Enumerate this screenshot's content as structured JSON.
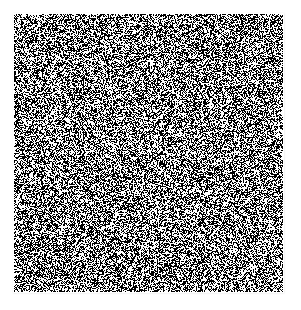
{
  "figure": {
    "kind": "noise-texture",
    "canvas_width": 301,
    "canvas_height": 310,
    "background_color": "#ffffff"
  },
  "chart_data": {
    "type": "heatmap",
    "title": "",
    "subtitle": "",
    "xlabel": "",
    "ylabel": "",
    "legend": [],
    "annotations": [],
    "grid": false,
    "axes_visible": false,
    "tick_labels_x": [],
    "tick_labels_y": [],
    "value_levels": [
      0,
      1
    ],
    "level_colors": [
      "#ffffff",
      "#000000"
    ],
    "black_fraction": 0.5,
    "grain_size_px": 1,
    "seed": 20240517,
    "patch": {
      "x": 14,
      "y": 14,
      "width": 269,
      "height": 278
    },
    "margins": {
      "left": 14,
      "top": 14,
      "right": 18,
      "bottom": 18
    },
    "compression": {
      "softening": true,
      "edge_ringing": true,
      "ring_color": "#8c8c8c"
    }
  }
}
